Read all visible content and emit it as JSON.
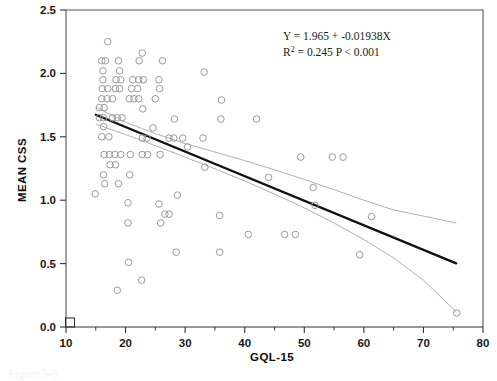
{
  "figure": {
    "caption_fragment": "Figure 5-3",
    "annotation_line1": "Y = 1.965 + -0.01938X",
    "annotation_line2_prefix": "R",
    "annotation_line2_sup": "2",
    "annotation_line2_rest": " = 0.245  P < 0.001"
  },
  "colors": {
    "axis": "#333333",
    "frame": "#555555",
    "point_stroke": "#9a9a9a",
    "fit_line": "#111111",
    "ci_line": "#b0b0b0",
    "text": "#1a1a1a",
    "background": "#ffffff"
  },
  "chart_data": {
    "type": "scatter",
    "title": "",
    "xlabel": "GQL-15",
    "ylabel": "MEAN CSS",
    "xlim": [
      10,
      80
    ],
    "ylim": [
      0.0,
      2.5
    ],
    "xticks": [
      10,
      20,
      30,
      40,
      50,
      60,
      70,
      80
    ],
    "xtick_labels": [
      "10",
      "20",
      "30",
      "40",
      "50",
      "60",
      "70",
      "80"
    ],
    "x_minor_ticks": [
      15,
      25,
      35,
      45,
      55,
      65,
      75
    ],
    "yticks": [
      0.0,
      0.5,
      1.0,
      1.5,
      2.0,
      2.5
    ],
    "ytick_labels": [
      "0.0",
      "0.5",
      "1.0",
      "1.5",
      "2.0",
      "2.5"
    ],
    "grid": false,
    "legend": null,
    "marker": "open-circle",
    "regression": {
      "equation": "Y = 1.965 + -0.01938X",
      "intercept": 1.965,
      "slope": -0.01938,
      "r_squared": 0.245,
      "p_value": "< 0.001",
      "x_start": 15.0,
      "x_end": 75.5,
      "y_start": 1.674,
      "y_end": 0.502
    },
    "confidence_band_upper": [
      [
        15.0,
        1.735
      ],
      [
        20.0,
        1.615
      ],
      [
        25.0,
        1.525
      ],
      [
        30.0,
        1.447
      ],
      [
        35.0,
        1.38
      ],
      [
        40.0,
        1.312
      ],
      [
        45.0,
        1.24
      ],
      [
        50.0,
        1.163
      ],
      [
        55.0,
        1.083
      ],
      [
        60.0,
        1.0
      ],
      [
        65.0,
        0.923
      ],
      [
        70.0,
        0.875
      ],
      [
        75.5,
        0.82
      ]
    ],
    "confidence_band_lower": [
      [
        15.0,
        1.6
      ],
      [
        20.0,
        1.518
      ],
      [
        25.0,
        1.43
      ],
      [
        30.0,
        1.34
      ],
      [
        35.0,
        1.248
      ],
      [
        40.0,
        1.152
      ],
      [
        45.0,
        1.048
      ],
      [
        50.0,
        0.94
      ],
      [
        55.0,
        0.82
      ],
      [
        60.0,
        0.69
      ],
      [
        65.0,
        0.545
      ],
      [
        70.0,
        0.37
      ],
      [
        75.5,
        0.12
      ]
    ],
    "points": [
      [
        17.0,
        2.25
      ],
      [
        16.0,
        2.1
      ],
      [
        16.6,
        2.1
      ],
      [
        18.8,
        2.1
      ],
      [
        22.8,
        2.16
      ],
      [
        22.3,
        2.1
      ],
      [
        26.2,
        2.1
      ],
      [
        16.2,
        2.02
      ],
      [
        19.0,
        2.02
      ],
      [
        33.2,
        2.01
      ],
      [
        16.2,
        1.95
      ],
      [
        18.4,
        1.95
      ],
      [
        19.2,
        1.95
      ],
      [
        21.2,
        1.95
      ],
      [
        22.2,
        1.95
      ],
      [
        23.0,
        1.95
      ],
      [
        25.6,
        1.95
      ],
      [
        16.1,
        1.88
      ],
      [
        17.0,
        1.88
      ],
      [
        18.3,
        1.88
      ],
      [
        19.0,
        1.88
      ],
      [
        21.0,
        1.88
      ],
      [
        22.0,
        1.88
      ],
      [
        25.7,
        1.88
      ],
      [
        16.0,
        1.8
      ],
      [
        16.9,
        1.8
      ],
      [
        17.8,
        1.8
      ],
      [
        20.6,
        1.8
      ],
      [
        21.4,
        1.8
      ],
      [
        22.2,
        1.8
      ],
      [
        25.0,
        1.8
      ],
      [
        36.1,
        1.79
      ],
      [
        15.6,
        1.73
      ],
      [
        16.4,
        1.73
      ],
      [
        22.9,
        1.72
      ],
      [
        15.6,
        1.65
      ],
      [
        16.3,
        1.65
      ],
      [
        17.8,
        1.65
      ],
      [
        18.6,
        1.65
      ],
      [
        19.4,
        1.65
      ],
      [
        28.2,
        1.64
      ],
      [
        36.0,
        1.64
      ],
      [
        42.0,
        1.64
      ],
      [
        16.3,
        1.58
      ],
      [
        24.6,
        1.57
      ],
      [
        16.0,
        1.5
      ],
      [
        17.2,
        1.5
      ],
      [
        22.8,
        1.49
      ],
      [
        23.6,
        1.49
      ],
      [
        27.3,
        1.49
      ],
      [
        28.1,
        1.49
      ],
      [
        29.6,
        1.49
      ],
      [
        33.0,
        1.49
      ],
      [
        30.4,
        1.42
      ],
      [
        16.4,
        1.36
      ],
      [
        17.3,
        1.36
      ],
      [
        18.2,
        1.36
      ],
      [
        19.2,
        1.36
      ],
      [
        20.8,
        1.36
      ],
      [
        22.8,
        1.36
      ],
      [
        23.7,
        1.36
      ],
      [
        25.8,
        1.36
      ],
      [
        49.4,
        1.34
      ],
      [
        54.7,
        1.34
      ],
      [
        56.5,
        1.34
      ],
      [
        17.4,
        1.28
      ],
      [
        18.3,
        1.28
      ],
      [
        33.3,
        1.26
      ],
      [
        16.3,
        1.2
      ],
      [
        20.7,
        1.2
      ],
      [
        44.0,
        1.18
      ],
      [
        16.5,
        1.13
      ],
      [
        18.8,
        1.13
      ],
      [
        51.5,
        1.1
      ],
      [
        14.9,
        1.05
      ],
      [
        28.7,
        1.04
      ],
      [
        20.4,
        0.98
      ],
      [
        25.6,
        0.97
      ],
      [
        51.8,
        0.96
      ],
      [
        26.6,
        0.89
      ],
      [
        27.3,
        0.89
      ],
      [
        35.8,
        0.88
      ],
      [
        61.3,
        0.87
      ],
      [
        20.4,
        0.82
      ],
      [
        25.9,
        0.82
      ],
      [
        40.6,
        0.73
      ],
      [
        46.7,
        0.73
      ],
      [
        48.5,
        0.73
      ],
      [
        28.5,
        0.59
      ],
      [
        35.8,
        0.59
      ],
      [
        59.3,
        0.57
      ],
      [
        20.5,
        0.51
      ],
      [
        22.7,
        0.37
      ],
      [
        18.6,
        0.29
      ],
      [
        75.6,
        0.11
      ]
    ]
  }
}
